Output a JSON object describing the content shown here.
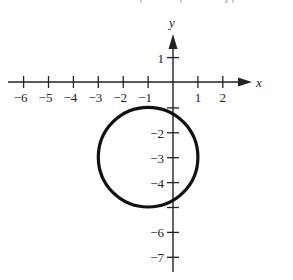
{
  "figure": {
    "type": "graph-of-circle",
    "axes": {
      "x_label": "x",
      "y_label": "y",
      "x_ticks": [
        -6,
        -5,
        -4,
        -3,
        -2,
        -1,
        1,
        2
      ],
      "x_tick_labels": [
        "−6",
        "−5",
        "−4",
        "−3",
        "−2",
        "−1",
        "1",
        "2"
      ],
      "y_ticks": [
        1,
        -1,
        -2,
        -3,
        -4,
        -5,
        -6,
        -7
      ],
      "y_tick_labels": [
        "1",
        "",
        "−2",
        "−3",
        "−4",
        "",
        "−6",
        "−7"
      ],
      "x_range": [
        -6.5,
        3.1
      ],
      "y_range": [
        -7.5,
        2.2
      ]
    },
    "circle": {
      "center": [
        -1,
        -3
      ],
      "radius": 2,
      "stroke_color": "#111111"
    },
    "colors": {
      "axis": "#222222",
      "background": "#ffffff"
    }
  },
  "chart_data": {
    "type": "scatter",
    "title": "",
    "xlabel": "x",
    "ylabel": "y",
    "xlim": [
      -6.5,
      3.1
    ],
    "ylim": [
      -7.5,
      2.2
    ],
    "grid": false,
    "series": [
      {
        "name": "circle (x+1)^2 + (y+3)^2 = 4",
        "shape": "circle",
        "center": [
          -1,
          -3
        ],
        "radius": 2,
        "extreme_points": [
          [
            -3,
            -3
          ],
          [
            1,
            -3
          ],
          [
            -1,
            -1
          ],
          [
            -1,
            -5
          ]
        ]
      }
    ]
  }
}
